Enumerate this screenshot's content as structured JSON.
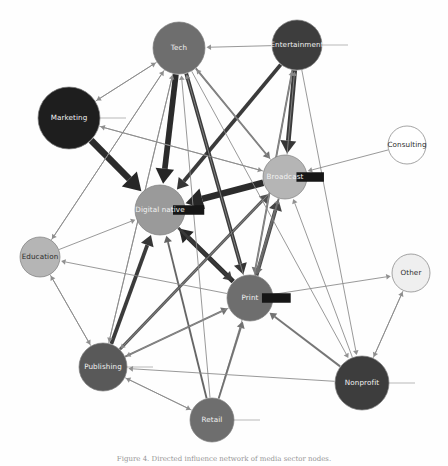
{
  "figure": {
    "type": "directed-network-graph",
    "caption": "Figure 4. Directed influence network of media sector nodes.",
    "background": "#fefefe"
  },
  "palette": {
    "very_dark": "#1e1e1e",
    "dark": "#3d3d3d",
    "mid_dark": "#595959",
    "mid": "#6e6e6e",
    "mid_light": "#9a9a9a",
    "light": "#b5b5b5",
    "very_light": "#d8d8d8",
    "near_white": "#efefef",
    "white": "#ffffff",
    "edge": "#8b8b8b",
    "edge_strong": "#1a1a1a",
    "label_light": "#f2f2f2",
    "label_dark": "#2b2b2b",
    "stroke": "#7d7d7d"
  },
  "nodes": [
    {
      "id": "tech",
      "label": "Tech",
      "x": 179,
      "y": 48,
      "r": 26,
      "fill": "#6e6e6e",
      "label_color": "#f2f2f2",
      "stub": "none"
    },
    {
      "id": "entertainment",
      "label": "Entertainment",
      "x": 297,
      "y": 45,
      "r": 25,
      "fill": "#3d3d3d",
      "label_color": "#f2f2f2",
      "stub": "right"
    },
    {
      "id": "marketing",
      "label": "Marketing",
      "x": 69,
      "y": 118,
      "r": 31,
      "fill": "#1e1e1e",
      "label_color": "#f2f2f2",
      "stub": "right"
    },
    {
      "id": "consulting",
      "label": "Consulting",
      "x": 407,
      "y": 145,
      "r": 19,
      "fill": "#ffffff",
      "label_color": "#2b2b2b",
      "stub": "none"
    },
    {
      "id": "broadcast",
      "label": "Broadcast",
      "x": 285,
      "y": 177,
      "r": 22,
      "fill": "#b5b5b5",
      "label_color": "#f2f2f2",
      "stub": "block-right"
    },
    {
      "id": "digital_native",
      "label": "Digital native",
      "x": 160,
      "y": 210,
      "r": 25,
      "fill": "#9a9a9a",
      "label_color": "#f2f2f2",
      "stub": "block-right"
    },
    {
      "id": "education",
      "label": "Education",
      "x": 40,
      "y": 257,
      "r": 20,
      "fill": "#b5b5b5",
      "label_color": "#2b2b2b",
      "stub": "none"
    },
    {
      "id": "other",
      "label": "Other",
      "x": 411,
      "y": 273,
      "r": 19,
      "fill": "#efefef",
      "label_color": "#2b2b2b",
      "stub": "none"
    },
    {
      "id": "print",
      "label": "Print",
      "x": 250,
      "y": 298,
      "r": 23,
      "fill": "#6e6e6e",
      "label_color": "#f2f2f2",
      "stub": "block-right"
    },
    {
      "id": "publishing",
      "label": "Publishing",
      "x": 103,
      "y": 367,
      "r": 24,
      "fill": "#595959",
      "label_color": "#f2f2f2",
      "stub": "right"
    },
    {
      "id": "nonprofit",
      "label": "Nonprofit",
      "x": 362,
      "y": 383,
      "r": 27,
      "fill": "#3d3d3d",
      "label_color": "#f2f2f2",
      "stub": "right"
    },
    {
      "id": "retail",
      "label": "Retail",
      "x": 212,
      "y": 420,
      "r": 22,
      "fill": "#6e6e6e",
      "label_color": "#f2f2f2",
      "stub": "right"
    }
  ],
  "edges": [
    {
      "source": "marketing",
      "target": "digital_native",
      "weight": 7,
      "color": "#1a1a1a"
    },
    {
      "source": "tech",
      "target": "digital_native",
      "weight": 6,
      "color": "#1a1a1a"
    },
    {
      "source": "broadcast",
      "target": "digital_native",
      "weight": 7,
      "color": "#1a1a1a"
    },
    {
      "source": "print",
      "target": "digital_native",
      "weight": 5,
      "color": "#1a1a1a"
    },
    {
      "source": "entertainment",
      "target": "digital_native",
      "weight": 4,
      "color": "#2b2b2b"
    },
    {
      "source": "publishing",
      "target": "digital_native",
      "weight": 4,
      "color": "#2b2b2b"
    },
    {
      "source": "retail",
      "target": "digital_native",
      "weight": 2,
      "color": "#5a5a5a"
    },
    {
      "source": "education",
      "target": "digital_native",
      "weight": 1,
      "color": "#8b8b8b"
    },
    {
      "source": "entertainment",
      "target": "broadcast",
      "weight": 5,
      "color": "#2b2b2b"
    },
    {
      "source": "tech",
      "target": "broadcast",
      "weight": 2,
      "color": "#6b6b6b"
    },
    {
      "source": "print",
      "target": "broadcast",
      "weight": 4,
      "color": "#3a3a3a"
    },
    {
      "source": "publishing",
      "target": "broadcast",
      "weight": 3,
      "color": "#4a4a4a"
    },
    {
      "source": "consulting",
      "target": "broadcast",
      "weight": 1,
      "color": "#8b8b8b"
    },
    {
      "source": "retail",
      "target": "broadcast",
      "weight": 1,
      "color": "#8b8b8b"
    },
    {
      "source": "nonprofit",
      "target": "broadcast",
      "weight": 1,
      "color": "#8b8b8b"
    },
    {
      "source": "marketing",
      "target": "broadcast",
      "weight": 1,
      "color": "#8b8b8b"
    },
    {
      "source": "tech",
      "target": "print",
      "weight": 4,
      "color": "#2b2b2b"
    },
    {
      "source": "entertainment",
      "target": "print",
      "weight": 2,
      "color": "#6b6b6b"
    },
    {
      "source": "broadcast",
      "target": "print",
      "weight": 2,
      "color": "#6b6b6b"
    },
    {
      "source": "publishing",
      "target": "print",
      "weight": 2,
      "color": "#6b6b6b"
    },
    {
      "source": "nonprofit",
      "target": "print",
      "weight": 2,
      "color": "#6b6b6b"
    },
    {
      "source": "retail",
      "target": "print",
      "weight": 2,
      "color": "#6b6b6b"
    },
    {
      "source": "digital_native",
      "target": "print",
      "weight": 3,
      "color": "#3a3a3a"
    },
    {
      "source": "marketing",
      "target": "tech",
      "weight": 1,
      "color": "#8b8b8b"
    },
    {
      "source": "entertainment",
      "target": "tech",
      "weight": 1,
      "color": "#8b8b8b"
    },
    {
      "source": "publishing",
      "target": "tech",
      "weight": 1,
      "color": "#8b8b8b"
    },
    {
      "source": "education",
      "target": "tech",
      "weight": 1,
      "color": "#8b8b8b"
    },
    {
      "source": "retail",
      "target": "tech",
      "weight": 1,
      "color": "#8b8b8b"
    },
    {
      "source": "print",
      "target": "tech",
      "weight": 1,
      "color": "#8b8b8b"
    },
    {
      "source": "broadcast",
      "target": "tech",
      "weight": 1,
      "color": "#8b8b8b"
    },
    {
      "source": "tech",
      "target": "marketing",
      "weight": 1,
      "color": "#8b8b8b"
    },
    {
      "source": "broadcast",
      "target": "marketing",
      "weight": 1,
      "color": "#8b8b8b"
    },
    {
      "source": "print",
      "target": "entertainment",
      "weight": 1,
      "color": "#8b8b8b"
    },
    {
      "source": "broadcast",
      "target": "entertainment",
      "weight": 1,
      "color": "#8b8b8b"
    },
    {
      "source": "tech",
      "target": "education",
      "weight": 1,
      "color": "#8b8b8b"
    },
    {
      "source": "print",
      "target": "education",
      "weight": 1,
      "color": "#8b8b8b"
    },
    {
      "source": "publishing",
      "target": "education",
      "weight": 1,
      "color": "#8b8b8b"
    },
    {
      "source": "tech",
      "target": "publishing",
      "weight": 1,
      "color": "#8b8b8b"
    },
    {
      "source": "education",
      "target": "publishing",
      "weight": 1,
      "color": "#8b8b8b"
    },
    {
      "source": "broadcast",
      "target": "publishing",
      "weight": 1,
      "color": "#8b8b8b"
    },
    {
      "source": "nonprofit",
      "target": "publishing",
      "weight": 1,
      "color": "#8b8b8b"
    },
    {
      "source": "retail",
      "target": "publishing",
      "weight": 1,
      "color": "#8b8b8b"
    },
    {
      "source": "print",
      "target": "publishing",
      "weight": 1,
      "color": "#8b8b8b"
    },
    {
      "source": "publishing",
      "target": "retail",
      "weight": 1,
      "color": "#8b8b8b"
    },
    {
      "source": "nonprofit",
      "target": "other",
      "weight": 1,
      "color": "#8b8b8b"
    },
    {
      "source": "print",
      "target": "other",
      "weight": 1,
      "color": "#8b8b8b"
    },
    {
      "source": "other",
      "target": "nonprofit",
      "weight": 1,
      "color": "#8b8b8b"
    },
    {
      "source": "entertainment",
      "target": "nonprofit",
      "weight": 1,
      "color": "#8b8b8b"
    },
    {
      "source": "tech",
      "target": "nonprofit",
      "weight": 1,
      "color": "#8b8b8b"
    }
  ]
}
